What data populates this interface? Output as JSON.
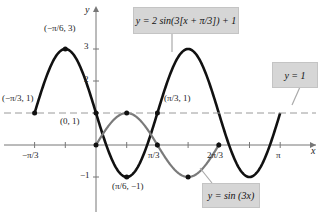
{
  "chart_data": {
    "type": "line",
    "title": "",
    "xlabel": "x",
    "ylabel": "y",
    "xlim": [
      -1.2,
      3.5
    ],
    "ylim": [
      -1.6,
      3.7
    ],
    "grid": false,
    "x_ticks": [
      {
        "value": -1.0472,
        "label": "-π/3"
      },
      {
        "value": -0.5236,
        "label": ""
      },
      {
        "value": 0.5236,
        "label": ""
      },
      {
        "value": 1.0472,
        "label": "π/3"
      },
      {
        "value": 1.5708,
        "label": ""
      },
      {
        "value": 2.0944,
        "label": "2π/3"
      },
      {
        "value": 2.618,
        "label": ""
      },
      {
        "value": 3.1416,
        "label": "π"
      }
    ],
    "y_ticks": [
      {
        "value": -1,
        "label": "−1"
      },
      {
        "value": 2,
        "label": "2"
      },
      {
        "value": 3,
        "label": "3"
      }
    ],
    "series": [
      {
        "name": "y = 2 sin(3[x + π/3]) + 1",
        "color": "#111111",
        "domain": [
          -1.0472,
          3.1416
        ],
        "formula": "2*sin(3*(x+pi/3))+1"
      },
      {
        "name": "y = sin(3x)",
        "color": "#7a7a7a",
        "domain": [
          0,
          2.0944
        ],
        "formula": "sin(3*x)"
      },
      {
        "name": "y = 1",
        "color": "#9a9a9a",
        "style": "dashed",
        "value": 1
      }
    ],
    "points": [
      {
        "x": -1.0472,
        "y": 1,
        "label": "(−π/3, 1)"
      },
      {
        "x": -0.5236,
        "y": 3,
        "label": "(−π/6, 3)"
      },
      {
        "x": 0,
        "y": 1,
        "label": "(0, 1)"
      },
      {
        "x": 0.5236,
        "y": -1,
        "label": "(π/6, −1)"
      },
      {
        "x": 1.0472,
        "y": 1,
        "label": "(π/3, 1)"
      },
      {
        "x": 0,
        "y": 0,
        "label": ""
      },
      {
        "x": 0.5236,
        "y": 1,
        "label": ""
      },
      {
        "x": 1.0472,
        "y": 0,
        "label": ""
      },
      {
        "x": 1.5708,
        "y": -1,
        "label": ""
      },
      {
        "x": 2.0944,
        "y": 0,
        "label": ""
      }
    ],
    "annotations": [
      "y = 2 sin(3[x + π/3]) + 1",
      "y = 1",
      "y = sin (3x)"
    ]
  },
  "labels": {
    "axis_x": "x",
    "axis_y": "y",
    "tick_neg_pi3": "−π/3",
    "tick_pi3": "π/3",
    "tick_2pi3": "2π/3",
    "tick_pi": "π",
    "ytick_3": "3",
    "ytick_2": "2",
    "ytick_neg1": "−1",
    "pt_neg_pi3": "(−π/3, 1)",
    "pt_neg_pi6": "(−π/6, 3)",
    "pt_origin1": "(0, 1)",
    "pt_pi6": "(π/6, −1)",
    "pt_pi3": "(π/3, 1)",
    "box_transformed": "y = 2 sin(3[x + π/3]) + 1",
    "box_y1": "y = 1",
    "box_sin": "y = sin (3x)"
  }
}
